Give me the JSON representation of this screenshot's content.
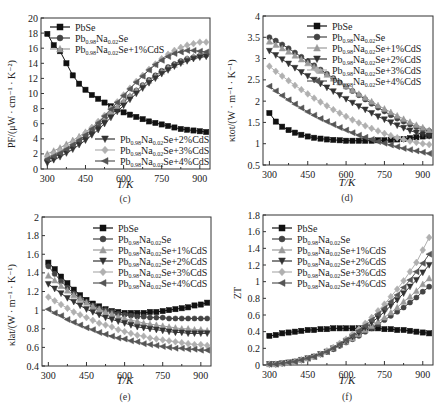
{
  "chart_data": [
    {
      "panel": "c",
      "type": "line",
      "caption": "(c)",
      "xlabel": "T/K",
      "ylabel": "PF/(μW · cm⁻¹ · K⁻²)",
      "xlim": [
        275,
        940
      ],
      "ylim": [
        0,
        20
      ],
      "xticks": [
        300,
        450,
        600,
        750,
        900
      ],
      "yticks": [
        0,
        2,
        4,
        6,
        8,
        10,
        12,
        14,
        16,
        18,
        20
      ],
      "x": [
        300,
        325,
        350,
        375,
        400,
        425,
        450,
        475,
        500,
        525,
        550,
        575,
        600,
        625,
        650,
        675,
        700,
        725,
        750,
        775,
        800,
        825,
        850,
        875,
        900,
        925
      ],
      "series": [
        {
          "name": "PbSe",
          "marker": "square",
          "color": "#111111",
          "values": [
            17.9,
            16.4,
            15.6,
            14.0,
            12.4,
            11.3,
            10.5,
            9.8,
            9.3,
            8.8,
            8.3,
            7.9,
            7.5,
            7.2,
            6.9,
            6.6,
            6.3,
            6.1,
            5.9,
            5.7,
            5.5,
            5.3,
            5.2,
            5.1,
            5.0,
            4.9
          ]
        },
        {
          "name": "Pb0.98Na0.02Se",
          "marker": "circle",
          "color": "#444444",
          "values": [
            1.2,
            1.6,
            2.0,
            2.5,
            3.0,
            3.6,
            4.2,
            4.9,
            5.6,
            6.4,
            7.2,
            8.0,
            8.8,
            9.6,
            10.4,
            11.1,
            11.8,
            12.4,
            13.0,
            13.5,
            13.9,
            14.3,
            14.6,
            14.8,
            15.0,
            15.1
          ]
        },
        {
          "name": "Pb0.98Na0.02Se+1%CdS",
          "marker": "triangle-up",
          "color": "#9a9a9a",
          "values": [
            2.0,
            2.4,
            2.8,
            3.3,
            3.8,
            4.3,
            4.9,
            5.5,
            6.2,
            6.9,
            7.6,
            8.3,
            9.0,
            9.7,
            10.4,
            11.1,
            11.7,
            12.3,
            12.9,
            13.4,
            13.8,
            14.2,
            14.6,
            14.9,
            15.1,
            15.3
          ]
        },
        {
          "name": "Pb0.98Na0.02Se+2%CdS",
          "marker": "triangle-down",
          "color": "#333333",
          "values": [
            0.8,
            1.2,
            1.6,
            2.1,
            2.6,
            3.2,
            3.8,
            4.5,
            5.2,
            6.0,
            6.8,
            7.6,
            8.4,
            9.2,
            10.0,
            10.7,
            11.4,
            12.0,
            12.6,
            13.1,
            13.6,
            14.0,
            14.3,
            14.6,
            14.8,
            14.9
          ]
        },
        {
          "name": "Pb0.98Na0.02Se+3%CdS",
          "marker": "diamond",
          "color": "#b0b0b0",
          "values": [
            1.6,
            2.0,
            2.4,
            2.9,
            3.5,
            4.1,
            4.8,
            5.5,
            6.3,
            7.1,
            8.0,
            8.9,
            9.8,
            10.7,
            11.6,
            12.4,
            13.2,
            13.9,
            14.6,
            15.2,
            15.7,
            16.1,
            16.4,
            16.6,
            16.8,
            16.8
          ]
        },
        {
          "name": "Pb0.98Na0.02Se+4%CdS",
          "marker": "triangle-left",
          "color": "#555555",
          "values": [
            1.3,
            1.7,
            2.1,
            2.6,
            3.2,
            3.8,
            4.5,
            5.3,
            6.1,
            7.0,
            7.9,
            8.8,
            9.7,
            10.6,
            11.5,
            12.3,
            13.1,
            13.8,
            14.4,
            14.9,
            15.3,
            15.5,
            15.7,
            15.7,
            15.6,
            15.5
          ]
        }
      ],
      "legend_position": "split: top-left (first 3), bottom-right (last 3)",
      "grid": false
    },
    {
      "panel": "d",
      "type": "line",
      "caption": "(d)",
      "xlabel": "T/K",
      "ylabel": "κtot/(W · m⁻¹ · K⁻¹)",
      "xlim": [
        275,
        940
      ],
      "ylim": [
        0.5,
        4.0
      ],
      "xticks": [
        300,
        450,
        600,
        750,
        900
      ],
      "yticks": [
        0.5,
        1.0,
        1.5,
        2.0,
        2.5,
        3.0,
        3.5,
        4.0
      ],
      "x": [
        300,
        325,
        350,
        375,
        400,
        425,
        450,
        475,
        500,
        525,
        550,
        575,
        600,
        625,
        650,
        675,
        700,
        725,
        750,
        775,
        800,
        825,
        850,
        875,
        900,
        925
      ],
      "series": [
        {
          "name": "PbSe",
          "marker": "square",
          "color": "#111111",
          "values": [
            1.72,
            1.52,
            1.4,
            1.32,
            1.26,
            1.21,
            1.17,
            1.14,
            1.12,
            1.1,
            1.09,
            1.08,
            1.07,
            1.07,
            1.07,
            1.07,
            1.07,
            1.08,
            1.08,
            1.09,
            1.1,
            1.11,
            1.13,
            1.15,
            1.17,
            1.19
          ]
        },
        {
          "name": "Pb0.98Na0.02Se",
          "marker": "circle",
          "color": "#444444",
          "values": [
            3.5,
            3.42,
            3.33,
            3.24,
            3.14,
            3.04,
            2.94,
            2.84,
            2.74,
            2.64,
            2.54,
            2.44,
            2.34,
            2.24,
            2.14,
            2.04,
            1.94,
            1.85,
            1.76,
            1.67,
            1.59,
            1.52,
            1.45,
            1.39,
            1.34,
            1.3
          ]
        },
        {
          "name": "Pb0.98Na0.02Se+1%CdS",
          "marker": "triangle-up",
          "color": "#9a9a9a",
          "values": [
            3.4,
            3.32,
            3.24,
            3.16,
            3.07,
            2.98,
            2.89,
            2.8,
            2.71,
            2.62,
            2.53,
            2.44,
            2.35,
            2.26,
            2.17,
            2.08,
            1.99,
            1.9,
            1.82,
            1.74,
            1.66,
            1.58,
            1.51,
            1.44,
            1.38,
            1.32
          ]
        },
        {
          "name": "Pb0.98Na0.02Se+2%CdS",
          "marker": "triangle-down",
          "color": "#333333",
          "values": [
            3.18,
            3.08,
            2.98,
            2.88,
            2.78,
            2.68,
            2.59,
            2.5,
            2.41,
            2.32,
            2.23,
            2.14,
            2.05,
            1.96,
            1.88,
            1.8,
            1.72,
            1.64,
            1.57,
            1.5,
            1.43,
            1.37,
            1.31,
            1.26,
            1.22,
            1.18
          ]
        },
        {
          "name": "Pb0.98Na0.02Se+3%CdS",
          "marker": "diamond",
          "color": "#b0b0b0",
          "values": [
            2.82,
            2.7,
            2.59,
            2.48,
            2.37,
            2.27,
            2.17,
            2.07,
            1.98,
            1.89,
            1.8,
            1.72,
            1.64,
            1.56,
            1.49,
            1.42,
            1.36,
            1.3,
            1.24,
            1.19,
            1.14,
            1.1,
            1.06,
            1.03,
            1.0,
            0.98
          ]
        },
        {
          "name": "Pb0.98Na0.02Se+4%CdS",
          "marker": "triangle-left",
          "color": "#555555",
          "values": [
            2.35,
            2.24,
            2.13,
            2.03,
            1.93,
            1.84,
            1.75,
            1.67,
            1.59,
            1.52,
            1.45,
            1.38,
            1.32,
            1.26,
            1.2,
            1.15,
            1.1,
            1.05,
            1.01,
            0.97,
            0.93,
            0.89,
            0.86,
            0.83,
            0.8,
            0.77
          ]
        }
      ],
      "legend_position": "upper right",
      "grid": false
    },
    {
      "panel": "e",
      "type": "line",
      "caption": "(e)",
      "xlabel": "T/K",
      "ylabel": "κlat/(W · m⁻¹ · K⁻¹)",
      "xlim": [
        275,
        940
      ],
      "ylim": [
        0.4,
        2.0
      ],
      "xticks": [
        300,
        450,
        600,
        750,
        900
      ],
      "yticks": [
        0.4,
        0.6,
        0.8,
        1.0,
        1.2,
        1.4,
        1.6,
        1.8,
        2.0
      ],
      "x": [
        300,
        325,
        350,
        375,
        400,
        425,
        450,
        475,
        500,
        525,
        550,
        575,
        600,
        625,
        650,
        675,
        700,
        725,
        750,
        775,
        800,
        825,
        850,
        875,
        900,
        925
      ],
      "series": [
        {
          "name": "PbSe",
          "marker": "square",
          "color": "#111111",
          "values": [
            1.51,
            1.44,
            1.36,
            1.29,
            1.22,
            1.16,
            1.11,
            1.07,
            1.04,
            1.01,
            0.99,
            0.98,
            0.97,
            0.97,
            0.97,
            0.97,
            0.98,
            0.98,
            0.99,
            1.0,
            1.01,
            1.02,
            1.03,
            1.05,
            1.06,
            1.08
          ]
        },
        {
          "name": "Pb0.98Na0.02Se",
          "marker": "circle",
          "color": "#444444",
          "values": [
            1.47,
            1.39,
            1.31,
            1.24,
            1.18,
            1.13,
            1.09,
            1.05,
            1.02,
            1.0,
            0.98,
            0.96,
            0.95,
            0.94,
            0.93,
            0.93,
            0.92,
            0.92,
            0.92,
            0.91,
            0.91,
            0.91,
            0.91,
            0.91,
            0.91,
            0.91
          ]
        },
        {
          "name": "Pb0.98Na0.02Se+1%CdS",
          "marker": "triangle-up",
          "color": "#9a9a9a",
          "values": [
            1.37,
            1.32,
            1.26,
            1.21,
            1.16,
            1.12,
            1.08,
            1.04,
            1.01,
            0.98,
            0.96,
            0.93,
            0.91,
            0.89,
            0.88,
            0.86,
            0.85,
            0.84,
            0.83,
            0.82,
            0.81,
            0.8,
            0.8,
            0.79,
            0.79,
            0.78
          ]
        },
        {
          "name": "Pb0.98Na0.02Se+2%CdS",
          "marker": "triangle-down",
          "color": "#333333",
          "values": [
            1.28,
            1.23,
            1.18,
            1.13,
            1.09,
            1.05,
            1.01,
            0.98,
            0.95,
            0.92,
            0.9,
            0.88,
            0.86,
            0.84,
            0.82,
            0.81,
            0.8,
            0.79,
            0.78,
            0.77,
            0.76,
            0.76,
            0.75,
            0.75,
            0.75,
            0.75
          ]
        },
        {
          "name": "Pb0.98Na0.02Se+3%CdS",
          "marker": "diamond",
          "color": "#b0b0b0",
          "values": [
            1.14,
            1.1,
            1.06,
            1.02,
            0.98,
            0.95,
            0.92,
            0.89,
            0.86,
            0.84,
            0.82,
            0.79,
            0.77,
            0.75,
            0.73,
            0.72,
            0.7,
            0.69,
            0.68,
            0.67,
            0.66,
            0.65,
            0.64,
            0.63,
            0.63,
            0.62
          ]
        },
        {
          "name": "Pb0.98Na0.02Se+4%CdS",
          "marker": "triangle-left",
          "color": "#555555",
          "values": [
            1.01,
            0.97,
            0.94,
            0.9,
            0.87,
            0.84,
            0.81,
            0.79,
            0.76,
            0.74,
            0.72,
            0.7,
            0.69,
            0.67,
            0.66,
            0.64,
            0.63,
            0.62,
            0.61,
            0.6,
            0.59,
            0.59,
            0.58,
            0.58,
            0.57,
            0.57
          ]
        }
      ],
      "legend_position": "upper right",
      "grid": false
    },
    {
      "panel": "f",
      "type": "line",
      "caption": "(f)",
      "xlabel": "T/K",
      "ylabel": "ZT",
      "xlim": [
        275,
        940
      ],
      "ylim": [
        0,
        1.8
      ],
      "xticks": [
        300,
        450,
        600,
        750,
        900
      ],
      "yticks": [
        0,
        0.2,
        0.4,
        0.6,
        0.8,
        1.0,
        1.2,
        1.4,
        1.6,
        1.8
      ],
      "x": [
        300,
        325,
        350,
        375,
        400,
        425,
        450,
        475,
        500,
        525,
        550,
        575,
        600,
        625,
        650,
        675,
        700,
        725,
        750,
        775,
        800,
        825,
        850,
        875,
        900,
        925
      ],
      "series": [
        {
          "name": "PbSe",
          "marker": "square",
          "color": "#111111",
          "values": [
            0.35,
            0.36,
            0.38,
            0.39,
            0.4,
            0.41,
            0.42,
            0.42,
            0.43,
            0.43,
            0.44,
            0.44,
            0.44,
            0.44,
            0.44,
            0.44,
            0.44,
            0.44,
            0.43,
            0.43,
            0.42,
            0.42,
            0.41,
            0.4,
            0.39,
            0.38
          ]
        },
        {
          "name": "Pb0.98Na0.02Se",
          "marker": "circle",
          "color": "#444444",
          "values": [
            0.01,
            0.01,
            0.02,
            0.03,
            0.04,
            0.06,
            0.08,
            0.1,
            0.13,
            0.16,
            0.19,
            0.23,
            0.27,
            0.31,
            0.35,
            0.4,
            0.44,
            0.49,
            0.54,
            0.59,
            0.64,
            0.69,
            0.75,
            0.81,
            0.88,
            0.94
          ]
        },
        {
          "name": "Pb0.98Na0.02Se+1%CdS",
          "marker": "triangle-up",
          "color": "#9a9a9a",
          "values": [
            0.01,
            0.01,
            0.02,
            0.03,
            0.04,
            0.06,
            0.08,
            0.1,
            0.13,
            0.16,
            0.2,
            0.24,
            0.28,
            0.32,
            0.37,
            0.42,
            0.47,
            0.52,
            0.57,
            0.63,
            0.69,
            0.76,
            0.82,
            0.89,
            0.97,
            1.04
          ]
        },
        {
          "name": "Pb0.98Na0.02Se+2%CdS",
          "marker": "triangle-down",
          "color": "#333333",
          "values": [
            0.01,
            0.01,
            0.02,
            0.03,
            0.04,
            0.06,
            0.08,
            0.1,
            0.13,
            0.16,
            0.2,
            0.24,
            0.29,
            0.34,
            0.39,
            0.45,
            0.51,
            0.57,
            0.64,
            0.71,
            0.78,
            0.86,
            0.94,
            1.02,
            1.11,
            1.2
          ]
        },
        {
          "name": "Pb0.98Na0.02Se+3%CdS",
          "marker": "diamond",
          "color": "#b0b0b0",
          "values": [
            0.01,
            0.01,
            0.02,
            0.03,
            0.04,
            0.06,
            0.08,
            0.1,
            0.13,
            0.17,
            0.21,
            0.26,
            0.31,
            0.37,
            0.43,
            0.5,
            0.57,
            0.65,
            0.73,
            0.82,
            0.91,
            1.01,
            1.12,
            1.23,
            1.38,
            1.53
          ]
        },
        {
          "name": "Pb0.98Na0.02Se+4%CdS",
          "marker": "triangle-left",
          "color": "#555555",
          "values": [
            0.01,
            0.01,
            0.02,
            0.03,
            0.04,
            0.06,
            0.08,
            0.1,
            0.13,
            0.16,
            0.2,
            0.25,
            0.3,
            0.35,
            0.41,
            0.47,
            0.54,
            0.61,
            0.68,
            0.76,
            0.84,
            0.93,
            1.02,
            1.12,
            1.22,
            1.33
          ]
        }
      ],
      "legend_position": "upper left",
      "grid": false
    }
  ],
  "panels": {
    "c": {
      "caption": "(c)",
      "xlabel": "T/K",
      "ylabel": "PF/(μW · cm⁻¹ · K⁻²)"
    },
    "d": {
      "caption": "(d)",
      "xlabel": "T/K",
      "ylabel": "κtot/(W · m⁻¹ · K⁻¹)"
    },
    "e": {
      "caption": "(e)",
      "xlabel": "T/K",
      "ylabel": "κlat/(W · m⁻¹ · K⁻¹)"
    },
    "f": {
      "caption": "(f)",
      "xlabel": "T/K",
      "ylabel": "ZT"
    }
  },
  "legend_labels": [
    {
      "base": "PbSe",
      "sub1": "",
      "mid": "",
      "sub2": "",
      "tail": ""
    },
    {
      "base": "Pb",
      "sub1": "0.98",
      "mid": "Na",
      "sub2": "0.02",
      "tail": "Se"
    },
    {
      "base": "Pb",
      "sub1": "0.98",
      "mid": "Na",
      "sub2": "0.02",
      "tail": "Se+1%CdS"
    },
    {
      "base": "Pb",
      "sub1": "0.98",
      "mid": "Na",
      "sub2": "0.02",
      "tail": "Se+2%CdS"
    },
    {
      "base": "Pb",
      "sub1": "0.98",
      "mid": "Na",
      "sub2": "0.02",
      "tail": "Se+3%CdS"
    },
    {
      "base": "Pb",
      "sub1": "0.98",
      "mid": "Na",
      "sub2": "0.02",
      "tail": "Se+4%CdS"
    }
  ]
}
